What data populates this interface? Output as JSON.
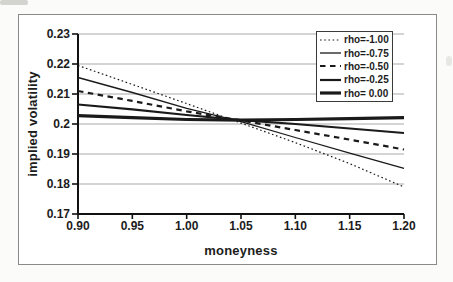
{
  "figure": {
    "background": "#fbfbf9",
    "frame_border": "#8a8a8a"
  },
  "chart_data": {
    "type": "line",
    "title": "",
    "xlabel": "moneyness",
    "ylabel": "implied volatility",
    "xlim": [
      0.9,
      1.2
    ],
    "ylim": [
      0.17,
      0.23
    ],
    "grid": true,
    "legend_position": "top-right",
    "x": [
      0.9,
      0.95,
      1.0,
      1.05,
      1.1,
      1.15,
      1.2
    ],
    "xtick_labels": [
      "0.90",
      "0.95",
      "1.00",
      "1.05",
      "1.10",
      "1.15",
      "1.20"
    ],
    "ytick_values": [
      0.23,
      0.22,
      0.21,
      0.2,
      0.19,
      0.18,
      0.17
    ],
    "ytick_labels": [
      "0.23",
      "0.22",
      "0.21",
      "0.2",
      "0.19",
      "0.18",
      "0.17"
    ],
    "colors": {
      "line": "#1a1a1a",
      "grid": "#a9a9a9",
      "axis": "#111111",
      "legend_border": "#3a3a3a"
    },
    "series": [
      {
        "name": "rho=-1.00",
        "style": "dotted",
        "stroke_width": 1.2,
        "dash": "1.6 2.6",
        "values": [
          0.2195,
          0.2132,
          0.2068,
          0.2003,
          0.1938,
          0.1868,
          0.179
        ]
      },
      {
        "name": "rho=-0.75",
        "style": "solid-thin",
        "stroke_width": 1.3,
        "dash": "",
        "values": [
          0.2155,
          0.2105,
          0.2052,
          0.2008,
          0.1955,
          0.1903,
          0.1852
        ]
      },
      {
        "name": "rho=-0.50",
        "style": "dashed",
        "stroke_width": 2.2,
        "dash": "5.5 4.5",
        "values": [
          0.211,
          0.2077,
          0.2042,
          0.2012,
          0.198,
          0.1948,
          0.1915
        ]
      },
      {
        "name": "rho=-0.25",
        "style": "solid-medium",
        "stroke_width": 2.2,
        "dash": "",
        "values": [
          0.2065,
          0.2049,
          0.203,
          0.2013,
          0.2,
          0.1985,
          0.197
        ]
      },
      {
        "name": "rho= 0.00",
        "style": "solid-thick",
        "stroke_width": 3.2,
        "dash": "",
        "values": [
          0.2028,
          0.2021,
          0.2015,
          0.2013,
          0.2015,
          0.2018,
          0.2021
        ]
      }
    ]
  }
}
